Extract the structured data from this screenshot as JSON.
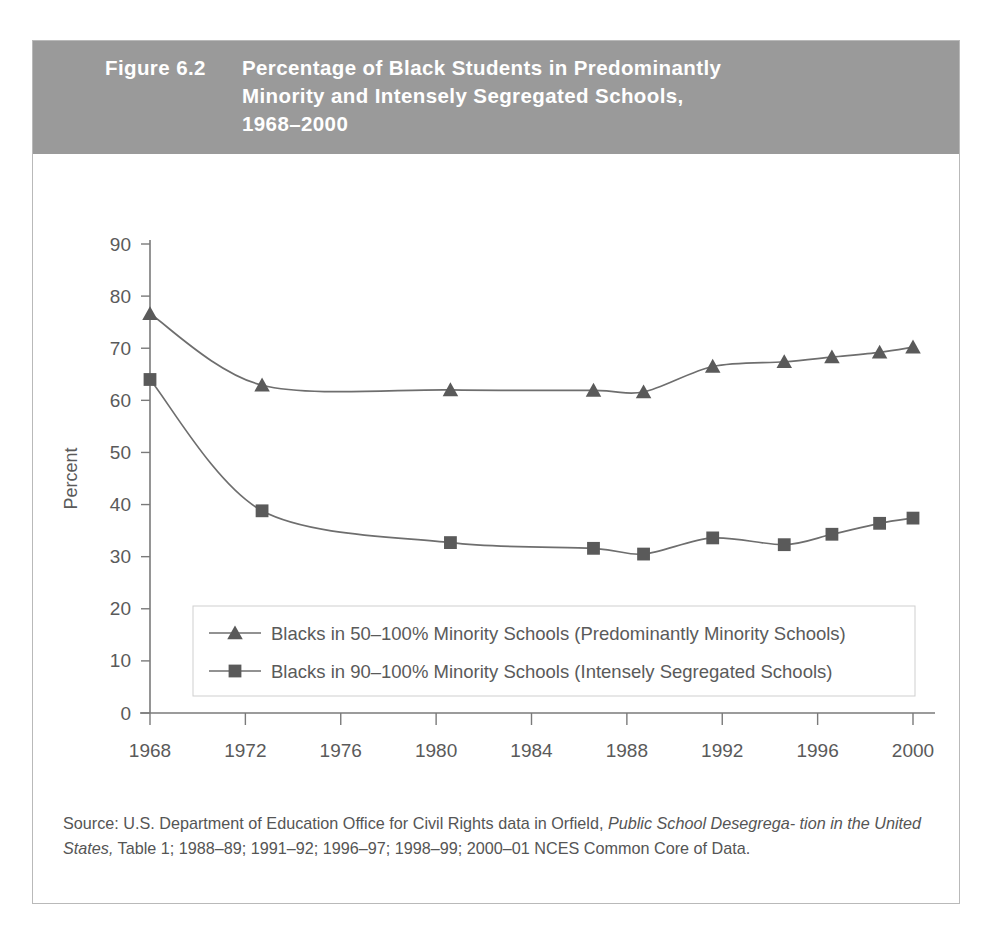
{
  "figure": {
    "label": "Figure 6.2",
    "title_line1": "Percentage of Black Students in Predominantly",
    "title_line2": "Minority and Intensely Segregated Schools,",
    "title_line3": "1968–2000",
    "header_bg": "#9a9a9a",
    "header_text_color": "#ffffff"
  },
  "source": {
    "prefix": "Source: U.S. Department of Education Office for Civil Rights data in Orfield,",
    "italic1": "Public School Desegrega-",
    "italic2": "tion in the United States,",
    "rest": "Table 1; 1988–89; 1991–92; 1996–97; 1998–99; 2000–01 NCES Common Core of Data."
  },
  "chart_data": {
    "type": "line",
    "title": "Percentage of Black Students in Predominantly Minority and Intensely Segregated Schools, 1968–2000",
    "xlabel": "Year",
    "ylabel": "Percent",
    "xlim": [
      1968,
      2000
    ],
    "ylim": [
      0,
      90
    ],
    "xticks": [
      1968,
      1972,
      1976,
      1980,
      1984,
      1988,
      1992,
      1996,
      2000
    ],
    "xticklabels": [
      "1968",
      "1972",
      "1976",
      "1980",
      "1984",
      "1988",
      "1992",
      "1996",
      "2000"
    ],
    "yticks": [
      0,
      10,
      20,
      30,
      40,
      50,
      60,
      70,
      80,
      90
    ],
    "yticklabels": [
      "0",
      "10",
      "20",
      "30",
      "40",
      "50",
      "60",
      "70",
      "80",
      "90"
    ],
    "grid": false,
    "legend_position": "lower-center-inside",
    "marker_color": "#5a5a5a",
    "line_color": "#6e6e6e",
    "x": [
      1968,
      1972.7,
      1980.6,
      1986.6,
      1988.7,
      1991.6,
      1994.6,
      1996.6,
      1998.6,
      2000.0
    ],
    "series": [
      {
        "name": "Blacks in 50–100% Minority Schools (Predominantly Minority Schools)",
        "marker": "triangle",
        "values": [
          76.6,
          62.9,
          62.0,
          61.9,
          61.6,
          66.5,
          67.4,
          68.3,
          69.2,
          70.2
        ]
      },
      {
        "name": "Blacks in 90–100% Minority Schools (Intensely Segregated Schools)",
        "marker": "square",
        "values": [
          64.0,
          38.8,
          32.7,
          31.6,
          30.5,
          33.6,
          32.3,
          34.3,
          36.4,
          37.4
        ]
      }
    ]
  }
}
